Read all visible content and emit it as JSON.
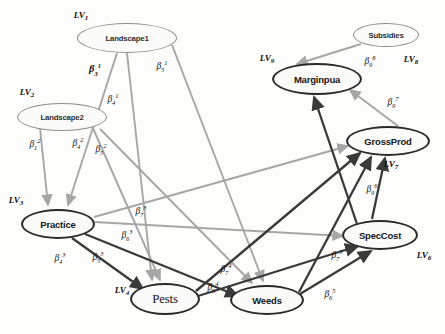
{
  "figure": {
    "type": "path-diagram",
    "canvas": {
      "width": 445,
      "height": 334,
      "background": "#fdfdfc"
    }
  },
  "colors": {
    "node_heavy_stroke": "#2a2a2a",
    "node_light_stroke": "#8d8d8d",
    "edge_dark": "#3a3a3a",
    "edge_light": "#a6a6a6",
    "text": "#111111"
  },
  "nodes": [
    {
      "id": "landscape1",
      "label": "Landscape1",
      "lv": "LV",
      "lv_index": "1",
      "style": "light",
      "cx": 127,
      "cy": 38,
      "rx": 50,
      "ry": 15,
      "lv_x": 81,
      "lv_y": 16
    },
    {
      "id": "landscape2",
      "label": "Landscape2",
      "lv": "LV",
      "lv_index": "2",
      "style": "light",
      "cx": 62,
      "cy": 117,
      "rx": 45,
      "ry": 14,
      "lv_x": 27,
      "lv_y": 93
    },
    {
      "id": "practice",
      "label": "Practice",
      "lv": "LV",
      "lv_index": "3",
      "style": "heavy",
      "cx": 58,
      "cy": 224,
      "rx": 37,
      "ry": 15,
      "lv_x": 14,
      "lv_y": 201
    },
    {
      "id": "pests",
      "label": "Pests",
      "lv": "LV",
      "lv_index": "4",
      "style": "heavy",
      "cx": 165,
      "cy": 299,
      "rx": 35,
      "ry": 16,
      "lv_x": 122,
      "lv_y": 291
    },
    {
      "id": "weeds",
      "label": "Weeds",
      "lv": "LV",
      "lv_index": "5",
      "style": "heavy",
      "cx": 267,
      "cy": 300,
      "rx": 37,
      "ry": 15,
      "lv_x": 0,
      "lv_y": 0
    },
    {
      "id": "speccost",
      "label": "SpecCost",
      "lv": "LV",
      "lv_index": "6",
      "style": "heavy",
      "cx": 380,
      "cy": 235,
      "rx": 38,
      "ry": 15,
      "lv_x": 424,
      "lv_y": 256
    },
    {
      "id": "grossprod",
      "label": "GrossProd",
      "lv": "LV",
      "lv_index": "7",
      "style": "heavy",
      "cx": 388,
      "cy": 141,
      "rx": 42,
      "ry": 15,
      "lv_x": 391,
      "lv_y": 165
    },
    {
      "id": "subsidies",
      "label": "Subsidies",
      "lv": "LV",
      "lv_index": "8",
      "style": "light",
      "cx": 386,
      "cy": 35,
      "rx": 33,
      "ry": 12,
      "lv_x": 411,
      "lv_y": 60
    },
    {
      "id": "marginpua",
      "label": "Marginpua",
      "lv": "LV",
      "lv_index": "9",
      "style": "heavy",
      "cx": 317,
      "cy": 79,
      "rx": 45,
      "ry": 16,
      "lv_x": 267,
      "lv_y": 59
    }
  ],
  "edges": [
    {
      "id": "e1",
      "from": "landscape1",
      "to": "practice",
      "tone": "light",
      "beta_sub": "3",
      "beta_sup": "1",
      "bold": true,
      "label_x": 95,
      "label_y": 70
    },
    {
      "id": "e2",
      "from": "landscape1",
      "to": "pests",
      "tone": "light",
      "beta_sub": "4",
      "beta_sup": "1",
      "bold": false,
      "label_x": 113,
      "label_y": 100
    },
    {
      "id": "e3",
      "from": "landscape1",
      "to": "weeds",
      "tone": "light",
      "beta_sub": "5",
      "beta_sup": "1",
      "bold": false,
      "label_x": 162,
      "label_y": 67
    },
    {
      "id": "e4",
      "from": "landscape2",
      "to": "practice",
      "tone": "light",
      "beta_sub": "1",
      "beta_sup": "2",
      "bold": false,
      "label_x": 35,
      "label_y": 145
    },
    {
      "id": "e5",
      "from": "landscape2",
      "to": "pests",
      "tone": "light",
      "beta_sub": "4",
      "beta_sup": "2",
      "bold": false,
      "label_x": 78,
      "label_y": 144
    },
    {
      "id": "e6",
      "from": "landscape2",
      "to": "weeds",
      "tone": "light",
      "beta_sub": "5",
      "beta_sup": "2",
      "bold": false,
      "label_x": 101,
      "label_y": 150
    },
    {
      "id": "e7",
      "from": "practice",
      "to": "pests",
      "tone": "dark",
      "beta_sub": "4",
      "beta_sup": "3",
      "bold": false,
      "label_x": 60,
      "label_y": 259
    },
    {
      "id": "e8",
      "from": "practice",
      "to": "weeds",
      "tone": "dark",
      "beta_sub": "5",
      "beta_sup": "3",
      "bold": false,
      "label_x": 98,
      "label_y": 258
    },
    {
      "id": "e9",
      "from": "practice",
      "to": "speccost",
      "tone": "light",
      "beta_sub": "6",
      "beta_sup": "3",
      "bold": false,
      "label_x": 127,
      "label_y": 236
    },
    {
      "id": "e10",
      "from": "practice",
      "to": "grossprod",
      "tone": "light",
      "beta_sub": "7",
      "beta_sup": "3",
      "bold": false,
      "label_x": 141,
      "label_y": 212
    },
    {
      "id": "e11",
      "from": "pests",
      "to": "speccost",
      "tone": "dark",
      "beta_sub": "6",
      "beta_sup": "4",
      "bold": false,
      "label_x": 213,
      "label_y": 288
    },
    {
      "id": "e12",
      "from": "pests",
      "to": "grossprod",
      "tone": "dark",
      "beta_sub": "7",
      "beta_sup": "4",
      "bold": false,
      "label_x": 226,
      "label_y": 270
    },
    {
      "id": "e13",
      "from": "weeds",
      "to": "speccost",
      "tone": "dark",
      "beta_sub": "6",
      "beta_sup": "5",
      "bold": false,
      "label_x": 330,
      "label_y": 295
    },
    {
      "id": "e14",
      "from": "weeds",
      "to": "grossprod",
      "tone": "dark",
      "beta_sub": "7",
      "beta_sup": "5",
      "bold": false,
      "label_x": 337,
      "label_y": 256
    },
    {
      "id": "e15",
      "from": "speccost",
      "to": "grossprod",
      "tone": "dark",
      "beta_sub": "9",
      "beta_sup": "6",
      "bold": false,
      "label_x": 372,
      "label_y": 190
    },
    {
      "id": "e16",
      "from": "grossprod",
      "to": "marginpua",
      "tone": "light",
      "beta_sub": "9",
      "beta_sup": "7",
      "bold": false,
      "label_x": 393,
      "label_y": 103
    },
    {
      "id": "e17",
      "from": "subsidies",
      "to": "marginpua",
      "tone": "light",
      "beta_sub": "9",
      "beta_sup": "8",
      "bold": false,
      "label_x": 370,
      "label_y": 62
    },
    {
      "id": "e18",
      "from": "speccost",
      "to": "marginpua",
      "tone": "dark",
      "beta_sub": "",
      "beta_sup": "",
      "bold": false,
      "label_x": 0,
      "label_y": 0
    }
  ]
}
